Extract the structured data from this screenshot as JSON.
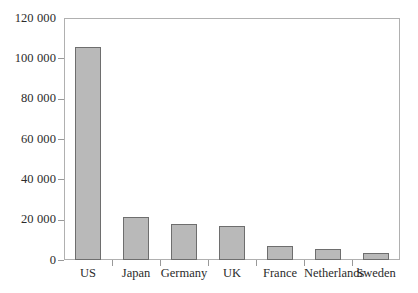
{
  "chart_data": {
    "type": "bar",
    "title": "",
    "subtitle": "",
    "xlabel": "",
    "ylabel": "",
    "categories": [
      "US",
      "Japan",
      "Germany",
      "UK",
      "France",
      "Netherlands",
      "Sweden"
    ],
    "values": [
      105500,
      21500,
      18000,
      17000,
      7000,
      5500,
      3500
    ],
    "ylim": [
      0,
      120000
    ],
    "ytick_values": [
      0,
      20000,
      40000,
      60000,
      80000,
      100000,
      120000
    ],
    "ytick_labels": [
      "0",
      "20 000",
      "40 000",
      "60 000",
      "80 000",
      "100 000",
      "120 000"
    ],
    "grid": false,
    "legend": null,
    "legend_position": "none",
    "bar_fill_color": "#b9b9b9",
    "bar_edge_color": "#6e6e6e",
    "frame_color": "#b0b0b0",
    "background_color": "#ffffff",
    "text_color": "#2b2b2b"
  }
}
